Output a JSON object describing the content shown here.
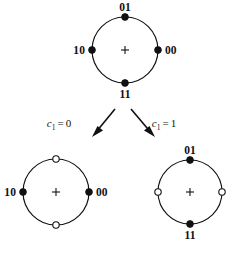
{
  "figure": {
    "background_color": "#ffffff",
    "ink_color": "#111111",
    "width": 241,
    "height": 254
  },
  "constellations": [
    {
      "id": "parent",
      "name": "parent-constellation",
      "center": {
        "x": 125,
        "y": 50
      },
      "radius": 33,
      "center_marker": "plus",
      "points": [
        {
          "id": "parent-top",
          "angle_deg": 90,
          "style": "filled",
          "label": "01",
          "label_pos": "above"
        },
        {
          "id": "parent-right",
          "angle_deg": 0,
          "style": "filled",
          "label": "00",
          "label_pos": "right"
        },
        {
          "id": "parent-bottom",
          "angle_deg": 270,
          "style": "filled",
          "label": "11",
          "label_pos": "below"
        },
        {
          "id": "parent-left",
          "angle_deg": 180,
          "style": "filled",
          "label": "10",
          "label_pos": "left"
        }
      ]
    },
    {
      "id": "subset-left",
      "name": "subset-c1-equals-0",
      "center": {
        "x": 56,
        "y": 192
      },
      "radius": 33,
      "center_marker": "plus",
      "points": [
        {
          "id": "left-top",
          "angle_deg": 90,
          "style": "open",
          "label": "",
          "label_pos": "above"
        },
        {
          "id": "left-right",
          "angle_deg": 0,
          "style": "filled",
          "label": "00",
          "label_pos": "right"
        },
        {
          "id": "left-bottom",
          "angle_deg": 270,
          "style": "open",
          "label": "",
          "label_pos": "below"
        },
        {
          "id": "left-left",
          "angle_deg": 180,
          "style": "filled",
          "label": "10",
          "label_pos": "left"
        }
      ]
    },
    {
      "id": "subset-right",
      "name": "subset-c1-equals-1",
      "center": {
        "x": 190,
        "y": 192
      },
      "radius": 32,
      "center_marker": "plus",
      "points": [
        {
          "id": "right-top",
          "angle_deg": 90,
          "style": "filled",
          "label": "01",
          "label_pos": "above"
        },
        {
          "id": "right-right",
          "angle_deg": 0,
          "style": "open",
          "label": "",
          "label_pos": "right"
        },
        {
          "id": "right-bottom",
          "angle_deg": 270,
          "style": "filled",
          "label": "11",
          "label_pos": "below"
        },
        {
          "id": "right-left",
          "angle_deg": 180,
          "style": "open",
          "label": "",
          "label_pos": "left"
        }
      ]
    }
  ],
  "arrows": [
    {
      "id": "arrow-left",
      "name": "branch-arrow-left",
      "from": {
        "x": 115,
        "y": 109
      },
      "to": {
        "x": 93,
        "y": 136
      },
      "label": {
        "symbol": "c",
        "subscript": "1",
        "operator": "=",
        "value": "0",
        "x": 59,
        "y": 126
      }
    },
    {
      "id": "arrow-right",
      "name": "branch-arrow-right",
      "from": {
        "x": 131,
        "y": 109
      },
      "to": {
        "x": 154,
        "y": 136
      },
      "label": {
        "symbol": "c",
        "subscript": "1",
        "operator": "=",
        "value": "1",
        "x": 164,
        "y": 126
      }
    }
  ]
}
